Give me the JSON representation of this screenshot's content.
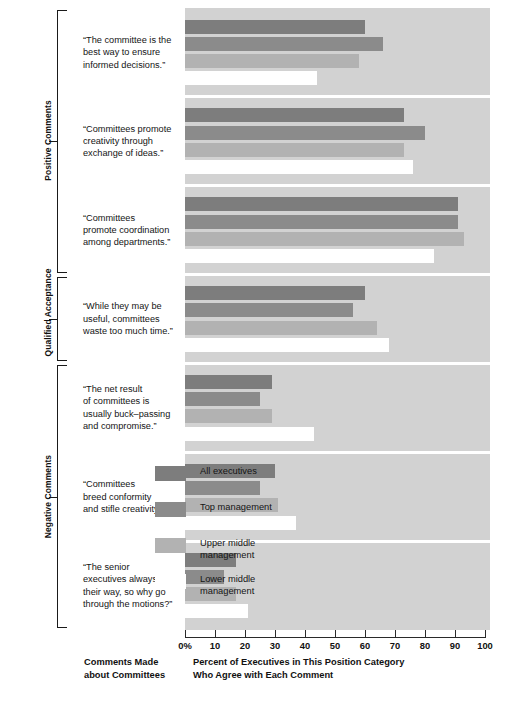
{
  "chart_data": {
    "type": "bar",
    "orientation": "horizontal",
    "title": "",
    "xlabel": "Percent of Executives in This Position Category\nWho Agree with Each Comment",
    "ylabel": "Comments Made\nabout Committees",
    "xlim": [
      0,
      100
    ],
    "xticks": [
      "0%",
      "10",
      "20",
      "30",
      "40",
      "50",
      "60",
      "70",
      "80",
      "90",
      "100"
    ],
    "xtick_values": [
      0,
      10,
      20,
      30,
      40,
      50,
      60,
      70,
      80,
      90,
      100
    ],
    "grid": false,
    "legend_position": "inside-lower-right",
    "series": [
      {
        "name": "All executives",
        "color": "#7d7d7d",
        "values": [
          60,
          73,
          91,
          60,
          29,
          30,
          17
        ]
      },
      {
        "name": "Top management",
        "color": "#8b8b8b",
        "values": [
          66,
          80,
          91,
          56,
          25,
          25,
          13
        ]
      },
      {
        "name": "Upper middle\nmanagement",
        "color": "#b2b2b2",
        "values": [
          58,
          73,
          93,
          64,
          29,
          31,
          17
        ]
      },
      {
        "name": "Lower middle\nmanagement",
        "color": "#ffffff",
        "values": [
          44,
          76,
          83,
          68,
          43,
          37,
          21
        ]
      }
    ],
    "categories": [
      "“The committee is the\nbest way to ensure\ninformed decisions.”",
      "“Committees promote\ncreativity through\nexchange of ideas.”",
      "“Committees\npromote coordination\namong departments.”",
      "“While they may be\nuseful, committees\nwaste too much time.”",
      "“The net result\nof committees is\nusually buck–passing\nand compromise.”",
      "“Committees\nbreed conformity\nand stifle creativity.”",
      "“The senior\nexecutives always get\ntheir way, so why go\nthrough the motions?”"
    ],
    "category_groups": [
      {
        "label": "Positive Comments",
        "from": 0,
        "to": 2
      },
      {
        "label": "Qualified\nAcceptance",
        "from": 3,
        "to": 3
      },
      {
        "label": "Negative Comments",
        "from": 4,
        "to": 6
      }
    ]
  },
  "colors": {
    "plot_background": "#d2d2d2",
    "separator": "#ffffff",
    "axis": "#2a2a2a",
    "text": "#141414"
  }
}
